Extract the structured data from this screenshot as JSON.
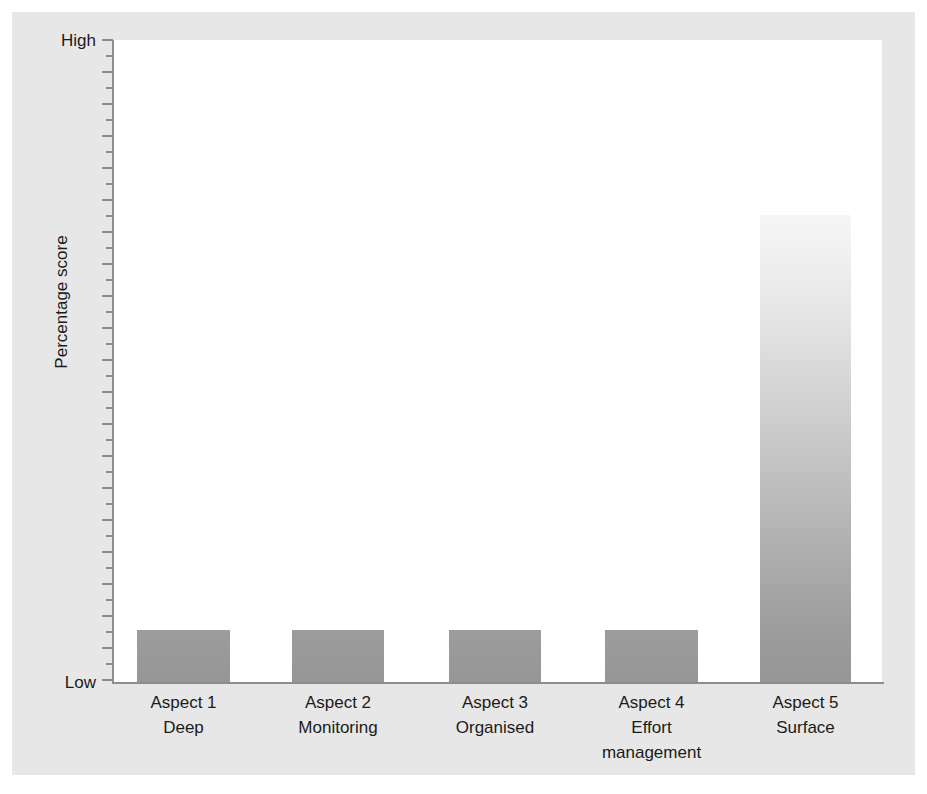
{
  "figure": {
    "background_color": "#e7e7e7",
    "plot_background_color": "#ffffff",
    "axis_color": "#8d8d8d",
    "text_color": "#1b1b1b",
    "bar_gradient_top": "#ffffff",
    "bar_gradient_bottom": "#969696"
  },
  "axes": {
    "y_title": "Percentage score",
    "y_high_label": "High",
    "y_low_label": "Low"
  },
  "chart_data": {
    "type": "bar",
    "title": "",
    "xlabel": "",
    "ylabel": "Percentage score",
    "ylim": [
      0,
      100
    ],
    "ytick_labels": [
      "Low",
      "High"
    ],
    "grid": false,
    "legend": "none",
    "categories": [
      "Aspect 1",
      "Aspect 2",
      "Aspect 3",
      "Aspect 4",
      "Aspect 5"
    ],
    "category_subtitles": [
      "Deep",
      "Monitoring",
      "Organised",
      "Effort management",
      "Surface"
    ],
    "values": [
      8,
      8,
      8,
      8,
      73
    ],
    "value_units": "percent of scale (Low=0, High=100)",
    "annotations": [
      "Aspect 5 (Surface) is markedly higher than Aspects 1-4",
      "Aspects 1-4 are all near the Low end of the scale"
    ]
  },
  "bars": [
    {
      "category": "Aspect 1",
      "subtitle": "Deep",
      "value": 8,
      "left_px": 137,
      "width_px": 93,
      "height_px": 52
    },
    {
      "category": "Aspect 2",
      "subtitle": "Monitoring",
      "value": 8,
      "left_px": 292,
      "width_px": 92,
      "height_px": 52
    },
    {
      "category": "Aspect 3",
      "subtitle": "Organised",
      "value": 8,
      "left_px": 449,
      "width_px": 92,
      "height_px": 52
    },
    {
      "category": "Aspect 4",
      "subtitle": "Effort management",
      "value": 8,
      "left_px": 605,
      "width_px": 93,
      "height_px": 52
    },
    {
      "category": "Aspect 5",
      "subtitle": "Surface",
      "value": 73,
      "left_px": 760,
      "width_px": 91,
      "height_px": 467
    }
  ]
}
